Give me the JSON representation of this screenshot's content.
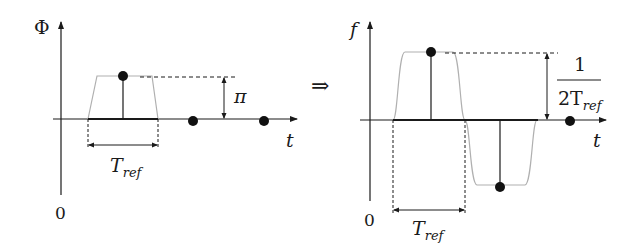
{
  "left_panel": {
    "y_axis_label": "Φ",
    "x_axis_label": "t",
    "origin_label": "0",
    "amplitude_label": "π",
    "width_label_main": "T",
    "width_label_sub": "ref"
  },
  "implies_symbol": "⇒",
  "right_panel": {
    "y_axis_label": "f",
    "x_axis_label": "t",
    "origin_label": "0",
    "amplitude_numerator": "1",
    "amplitude_denominator_main": "2T",
    "amplitude_denominator_sub": "ref",
    "width_label_main": "T",
    "width_label_sub": "ref"
  },
  "colors": {
    "axis": "#1a1a1a",
    "pulse_outline": "#b0b0b0",
    "dot": "#111111"
  }
}
